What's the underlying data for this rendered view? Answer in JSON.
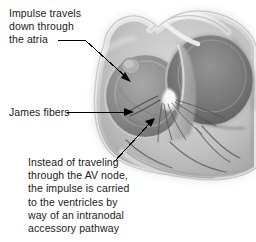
{
  "figure": {
    "type": "grayscale anatomical illustration",
    "colors": {
      "background": "#ffffff",
      "text": "#1a1a1a",
      "leader_line": "#000000",
      "tissue_light": "#e9e9e9",
      "tissue_mid": "#b4b4b4",
      "tissue_dark": "#808080",
      "tissue_darkest": "#5a5a5a",
      "highlight": "#f5f5f5"
    }
  },
  "annotations": {
    "atria": {
      "name": "impulse-travels-down-through-the-atria",
      "lines": [
        "Impulse travels",
        "down through",
        "the atria"
      ]
    },
    "james_fibers": {
      "name": "james-fibers",
      "lines": [
        "James fibers"
      ]
    },
    "accessory_pathway": {
      "name": "intranodal-accessory-pathway",
      "lines": [
        "Instead of traveling",
        "through the AV node,",
        "the impulse is carried",
        "to the ventricles by",
        "way of an intranodal",
        "accessory pathway"
      ]
    }
  },
  "leader_lines": [
    {
      "name": "leader-line-atria",
      "from_label": "the atria",
      "points": "58,40 84,40 130,81",
      "arrowhead_at": "130,81"
    },
    {
      "name": "leader-line-james-fibers",
      "from_label": "James fibers",
      "points": "67,112 131,112",
      "arrowhead_at": "131,112"
    },
    {
      "name": "leader-line-accessory-pathway",
      "from_label": "accessory pathway",
      "points": "114,162 154,119",
      "arrowhead_at": "154,119"
    }
  ]
}
